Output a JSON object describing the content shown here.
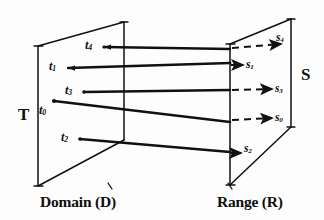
{
  "figure": {
    "ink_color": "#111111",
    "paper_color": "#fdfdfd"
  },
  "domain_plane": {
    "caption": "Domain (D)",
    "set_label": "T",
    "points": [
      {
        "id": "t4",
        "base": "t",
        "sub": "4",
        "label": "t4"
      },
      {
        "id": "t1",
        "base": "t",
        "sub": "1",
        "label": "t1"
      },
      {
        "id": "t3",
        "base": "t",
        "sub": "3",
        "label": "t3"
      },
      {
        "id": "t0",
        "base": "t",
        "sub": "0",
        "label": "t0"
      },
      {
        "id": "t2",
        "base": "t",
        "sub": "2",
        "label": "t2"
      }
    ]
  },
  "range_plane": {
    "caption": "Range (R)",
    "set_label": "S",
    "points": [
      {
        "id": "s4",
        "base": "s",
        "sub": "4",
        "label": "s4"
      },
      {
        "id": "s1",
        "base": "s",
        "sub": "1",
        "label": "s1"
      },
      {
        "id": "s3",
        "base": "s",
        "sub": "3",
        "label": "s3"
      },
      {
        "id": "s0",
        "base": "s",
        "sub": "0",
        "label": "s0"
      },
      {
        "id": "s2",
        "base": "s",
        "sub": "2",
        "label": "s2"
      }
    ]
  },
  "mappings": [
    {
      "from": "t4",
      "to": "s4",
      "style": "dashed-tail"
    },
    {
      "from": "t1",
      "to": "s1",
      "style": "solid"
    },
    {
      "from": "t3",
      "to": "s3",
      "style": "dashed-tail"
    },
    {
      "from": "t0",
      "to": "s0",
      "style": "dashed-tail"
    },
    {
      "from": "t2",
      "to": "s2",
      "style": "solid"
    }
  ]
}
